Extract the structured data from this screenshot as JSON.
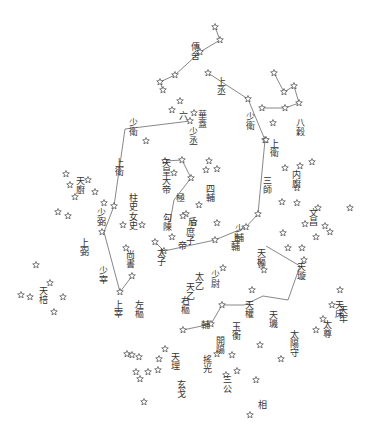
{
  "colors": {
    "ink": "#444444",
    "background": "#ffffff"
  },
  "stars": [
    [
      215,
      27
    ],
    [
      220,
      40
    ],
    [
      200,
      52
    ],
    [
      175,
      75
    ],
    [
      160,
      82
    ],
    [
      163,
      90
    ],
    [
      208,
      73
    ],
    [
      248,
      99
    ],
    [
      180,
      101
    ],
    [
      172,
      110
    ],
    [
      194,
      113
    ],
    [
      190,
      121
    ],
    [
      146,
      141
    ],
    [
      265,
      140
    ],
    [
      274,
      73
    ],
    [
      284,
      92
    ],
    [
      294,
      86
    ],
    [
      299,
      103
    ],
    [
      285,
      108
    ],
    [
      262,
      108
    ],
    [
      273,
      123
    ],
    [
      165,
      161
    ],
    [
      182,
      160
    ],
    [
      174,
      173
    ],
    [
      191,
      178
    ],
    [
      209,
      161
    ],
    [
      217,
      169
    ],
    [
      206,
      170
    ],
    [
      199,
      205
    ],
    [
      186,
      214
    ],
    [
      194,
      222
    ],
    [
      217,
      223
    ],
    [
      266,
      140
    ],
    [
      285,
      168
    ],
    [
      300,
      166
    ],
    [
      312,
      162
    ],
    [
      297,
      188
    ],
    [
      282,
      202
    ],
    [
      297,
      203
    ],
    [
      305,
      224
    ],
    [
      316,
      237
    ],
    [
      330,
      232
    ],
    [
      350,
      208
    ],
    [
      304,
      260
    ],
    [
      302,
      248
    ],
    [
      318,
      208
    ],
    [
      325,
      226
    ],
    [
      258,
      214
    ],
    [
      246,
      227
    ],
    [
      283,
      233
    ],
    [
      288,
      248
    ],
    [
      261,
      265
    ],
    [
      264,
      270
    ],
    [
      252,
      290
    ],
    [
      215,
      240
    ],
    [
      223,
      268
    ],
    [
      172,
      237
    ],
    [
      183,
      216
    ],
    [
      164,
      251
    ],
    [
      155,
      242
    ],
    [
      142,
      225
    ],
    [
      123,
      225
    ],
    [
      126,
      248
    ],
    [
      132,
      276
    ],
    [
      120,
      292
    ],
    [
      114,
      206
    ],
    [
      104,
      203
    ],
    [
      95,
      192
    ],
    [
      102,
      232
    ],
    [
      88,
      180
    ],
    [
      66,
      174
    ],
    [
      70,
      185
    ],
    [
      75,
      197
    ],
    [
      68,
      216
    ],
    [
      58,
      212
    ],
    [
      21,
      295
    ],
    [
      36,
      265
    ],
    [
      50,
      283
    ],
    [
      63,
      297
    ],
    [
      54,
      312
    ],
    [
      30,
      297
    ],
    [
      222,
      305
    ],
    [
      211,
      324
    ],
    [
      183,
      330
    ],
    [
      165,
      349
    ],
    [
      159,
      359
    ],
    [
      158,
      370
    ],
    [
      148,
      372
    ],
    [
      140,
      379
    ],
    [
      136,
      372
    ],
    [
      127,
      354
    ],
    [
      139,
      357
    ],
    [
      132,
      355
    ],
    [
      144,
      402
    ],
    [
      217,
      354
    ],
    [
      232,
      355
    ],
    [
      226,
      375
    ],
    [
      237,
      371
    ],
    [
      256,
      380
    ],
    [
      260,
      345
    ],
    [
      281,
      359
    ],
    [
      316,
      330
    ],
    [
      323,
      319
    ],
    [
      340,
      290
    ],
    [
      250,
      415
    ],
    [
      332,
      305
    ]
  ],
  "constellations": [
    {
      "name": "傳舍",
      "lines": [
        [
          215,
          27
        ],
        [
          220,
          40
        ],
        [
          200,
          52
        ],
        [
          175,
          75
        ],
        [
          160,
          82
        ],
        [
          163,
          90
        ]
      ]
    },
    {
      "name": "少衛-少丞",
      "lines": [
        [
          125,
          129
        ],
        [
          190,
          121
        ]
      ]
    },
    {
      "name": "東垣",
      "lines": [
        [
          208,
          73
        ],
        [
          248,
          99
        ],
        [
          265,
          140
        ],
        [
          258,
          214
        ],
        [
          246,
          227
        ],
        [
          215,
          240
        ],
        [
          164,
          251
        ],
        [
          155,
          242
        ]
      ]
    },
    {
      "name": "西垣",
      "lines": [
        [
          125,
          129
        ],
        [
          114,
          206
        ],
        [
          104,
          232
        ],
        [
          120,
          292
        ],
        [
          132,
          276
        ]
      ]
    },
    {
      "name": "八穀",
      "lines": [
        [
          274,
          73
        ],
        [
          284,
          92
        ],
        [
          294,
          86
        ],
        [
          299,
          103
        ],
        [
          285,
          108
        ],
        [
          262,
          108
        ]
      ]
    },
    {
      "name": "勾陳",
      "lines": [
        [
          165,
          161
        ],
        [
          182,
          160
        ],
        [
          191,
          178
        ],
        [
          174,
          200
        ],
        [
          170,
          222
        ]
      ]
    },
    {
      "name": "北斗",
      "lines": [
        [
          266,
          246
        ],
        [
          300,
          266
        ],
        [
          288,
          300
        ],
        [
          263,
          296
        ],
        [
          244,
          305
        ],
        [
          222,
          305
        ],
        [
          211,
          324
        ],
        [
          183,
          330
        ]
      ]
    }
  ],
  "labels": [
    {
      "text": "傳舍",
      "x": 190,
      "y": 42
    },
    {
      "text": "上丞",
      "x": 216,
      "y": 77
    },
    {
      "text": "華蓋",
      "x": 197,
      "y": 110
    },
    {
      "text": "六",
      "x": 178,
      "y": 111
    },
    {
      "text": "少丞",
      "x": 188,
      "y": 127
    },
    {
      "text": "少衛",
      "x": 128,
      "y": 118
    },
    {
      "text": "少衛",
      "x": 245,
      "y": 112
    },
    {
      "text": "八穀",
      "x": 295,
      "y": 118
    },
    {
      "text": "上衛",
      "x": 269,
      "y": 139
    },
    {
      "text": "天廚",
      "x": 75,
      "y": 176
    },
    {
      "text": "上衛",
      "x": 114,
      "y": 158
    },
    {
      "text": "天皇大帝",
      "x": 161,
      "y": 158
    },
    {
      "text": "四輔",
      "x": 205,
      "y": 184
    },
    {
      "text": "極",
      "x": 175,
      "y": 193
    },
    {
      "text": "内廚",
      "x": 291,
      "y": 170
    },
    {
      "text": "三師",
      "x": 262,
      "y": 176
    },
    {
      "text": "文昌",
      "x": 308,
      "y": 208
    },
    {
      "text": "柱史",
      "x": 128,
      "y": 193
    },
    {
      "text": "女史",
      "x": 128,
      "y": 212
    },
    {
      "text": "少弼",
      "x": 96,
      "y": 208
    },
    {
      "text": "勾陳",
      "x": 162,
      "y": 213
    },
    {
      "text": "后",
      "x": 187,
      "y": 217
    },
    {
      "text": "庶子",
      "x": 185,
      "y": 227
    },
    {
      "text": "帝",
      "x": 177,
      "y": 241
    },
    {
      "text": "太子",
      "x": 156,
      "y": 248
    },
    {
      "text": "上弼",
      "x": 79,
      "y": 238
    },
    {
      "text": "尚書",
      "x": 125,
      "y": 250
    },
    {
      "text": "少輔",
      "x": 234,
      "y": 224
    },
    {
      "text": "上輔",
      "x": 230,
      "y": 233
    },
    {
      "text": "天樞",
      "x": 256,
      "y": 248
    },
    {
      "text": "天璇",
      "x": 296,
      "y": 262
    },
    {
      "text": "天乙",
      "x": 185,
      "y": 282
    },
    {
      "text": "太乙",
      "x": 194,
      "y": 272
    },
    {
      "text": "少尉",
      "x": 210,
      "y": 270
    },
    {
      "text": "右樞",
      "x": 180,
      "y": 296
    },
    {
      "text": "少宰",
      "x": 98,
      "y": 266
    },
    {
      "text": "上宰",
      "x": 113,
      "y": 300
    },
    {
      "text": "左樞",
      "x": 134,
      "y": 300
    },
    {
      "text": "天棓",
      "x": 38,
      "y": 286
    },
    {
      "text": "天權",
      "x": 244,
      "y": 300
    },
    {
      "text": "天璣",
      "x": 268,
      "y": 310
    },
    {
      "text": "天床",
      "x": 334,
      "y": 300
    },
    {
      "text": "太陽守",
      "x": 289,
      "y": 330
    },
    {
      "text": "輔",
      "x": 200,
      "y": 320
    },
    {
      "text": "玉衡",
      "x": 231,
      "y": 322
    },
    {
      "text": "開陽",
      "x": 215,
      "y": 336
    },
    {
      "text": "搖光",
      "x": 202,
      "y": 355
    },
    {
      "text": "三公",
      "x": 222,
      "y": 375
    },
    {
      "text": "天理",
      "x": 170,
      "y": 352
    },
    {
      "text": "相",
      "x": 257,
      "y": 400
    },
    {
      "text": "玄戈",
      "x": 176,
      "y": 380
    },
    {
      "text": "天牢",
      "x": 338,
      "y": 305
    },
    {
      "text": "太尊",
      "x": 322,
      "y": 320
    }
  ]
}
